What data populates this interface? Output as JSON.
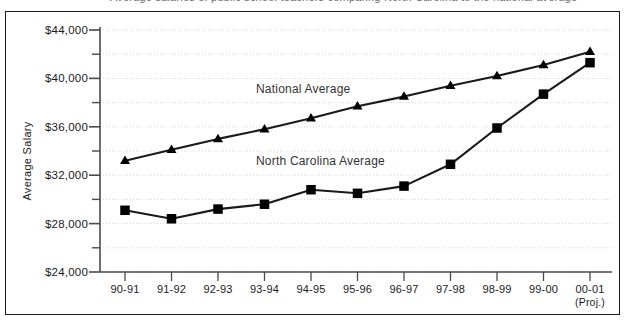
{
  "top_clipped_text": "Average salaries of public school teachers comparing North Carolina to the national average",
  "axes": {
    "y_axis_title": "Average Salary",
    "y_ticks": [
      "$44,000",
      "$40,000",
      "$36,000",
      "$32,000",
      "$28,000",
      "$24,000"
    ],
    "x_ticks": [
      "90-91",
      "91-92",
      "92-93",
      "93-94",
      "94-95",
      "95-96",
      "96-97",
      "97-98",
      "98-99",
      "99-00",
      "00-01"
    ],
    "x_last_sub": "(Proj.)"
  },
  "series_labels": {
    "national": "National Average",
    "north_carolina": "North Carolina Average"
  },
  "colors": {
    "line": "#1a1a1a",
    "marker": "#000000",
    "grid": "#cfcfcf",
    "axis": "#4a4a4a",
    "frame": "#1a1a1a",
    "text": "#1a1a1a"
  },
  "chart_data": {
    "type": "line",
    "title": "",
    "xlabel": "",
    "ylabel": "Average Salary",
    "ylim": [
      24000,
      44000
    ],
    "ytick_interval": 4000,
    "yminor_interval": 2000,
    "grid": true,
    "legend": "inline-annotations",
    "categories": [
      "90-91",
      "91-92",
      "92-93",
      "93-94",
      "94-95",
      "95-96",
      "96-97",
      "97-98",
      "98-99",
      "99-00",
      "00-01 (Proj.)"
    ],
    "series": [
      {
        "name": "National Average",
        "marker": "triangle",
        "values": [
          33200,
          34100,
          35000,
          35800,
          36700,
          37700,
          38500,
          39400,
          40200,
          41100,
          42200
        ]
      },
      {
        "name": "North Carolina Average",
        "marker": "square",
        "values": [
          29100,
          28400,
          29200,
          29600,
          30800,
          30500,
          31100,
          32900,
          35900,
          38700,
          41300
        ]
      }
    ]
  }
}
